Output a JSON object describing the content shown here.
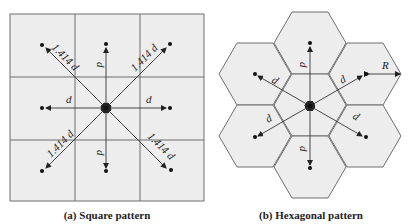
{
  "figure": {
    "panels": [
      {
        "id": "a",
        "caption": "(a) Square pattern",
        "shape": "square",
        "grid": "3x3",
        "center_node": true,
        "neighbors": [
          {
            "direction": "up",
            "label": "d"
          },
          {
            "direction": "down",
            "label": "d"
          },
          {
            "direction": "left",
            "label": "d"
          },
          {
            "direction": "right",
            "label": "d"
          },
          {
            "direction": "up-left",
            "label": "1.414 d"
          },
          {
            "direction": "up-right",
            "label": "1.414 d"
          },
          {
            "direction": "down-left",
            "label": "1.414 d"
          },
          {
            "direction": "down-right",
            "label": "1.414 d"
          }
        ]
      },
      {
        "id": "b",
        "caption": "(b) Hexagonal pattern",
        "shape": "hexagon",
        "cells": 7,
        "center_node": true,
        "neighbors": [
          {
            "direction": "up",
            "label": "d"
          },
          {
            "direction": "down",
            "label": "d"
          },
          {
            "direction": "up-left",
            "label": "d"
          },
          {
            "direction": "up-right",
            "label": "d"
          },
          {
            "direction": "down-left",
            "label": "d"
          },
          {
            "direction": "down-right",
            "label": "d"
          }
        ],
        "radius_label": "R"
      }
    ]
  },
  "labels": {
    "d": "d",
    "diag": "1.414 d",
    "R": "R",
    "caption_a": "(a) Square pattern",
    "caption_b": "(b) Hexagonal pattern"
  }
}
